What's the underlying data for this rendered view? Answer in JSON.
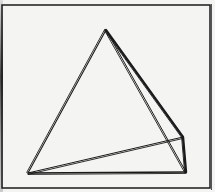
{
  "figure": {
    "vertices": [
      "apex",
      "bottom-left",
      "bottom-right",
      "right-back"
    ],
    "edges": [
      [
        "apex",
        "bottom-left"
      ],
      [
        "apex",
        "bottom-right"
      ],
      [
        "apex",
        "right-back"
      ],
      [
        "bottom-left",
        "bottom-right"
      ],
      [
        "bottom-left",
        "right-back"
      ],
      [
        "right-back",
        "bottom-right"
      ]
    ],
    "colors": {
      "paper": "#f4f4f2",
      "ink": "#1a1a1a"
    }
  }
}
